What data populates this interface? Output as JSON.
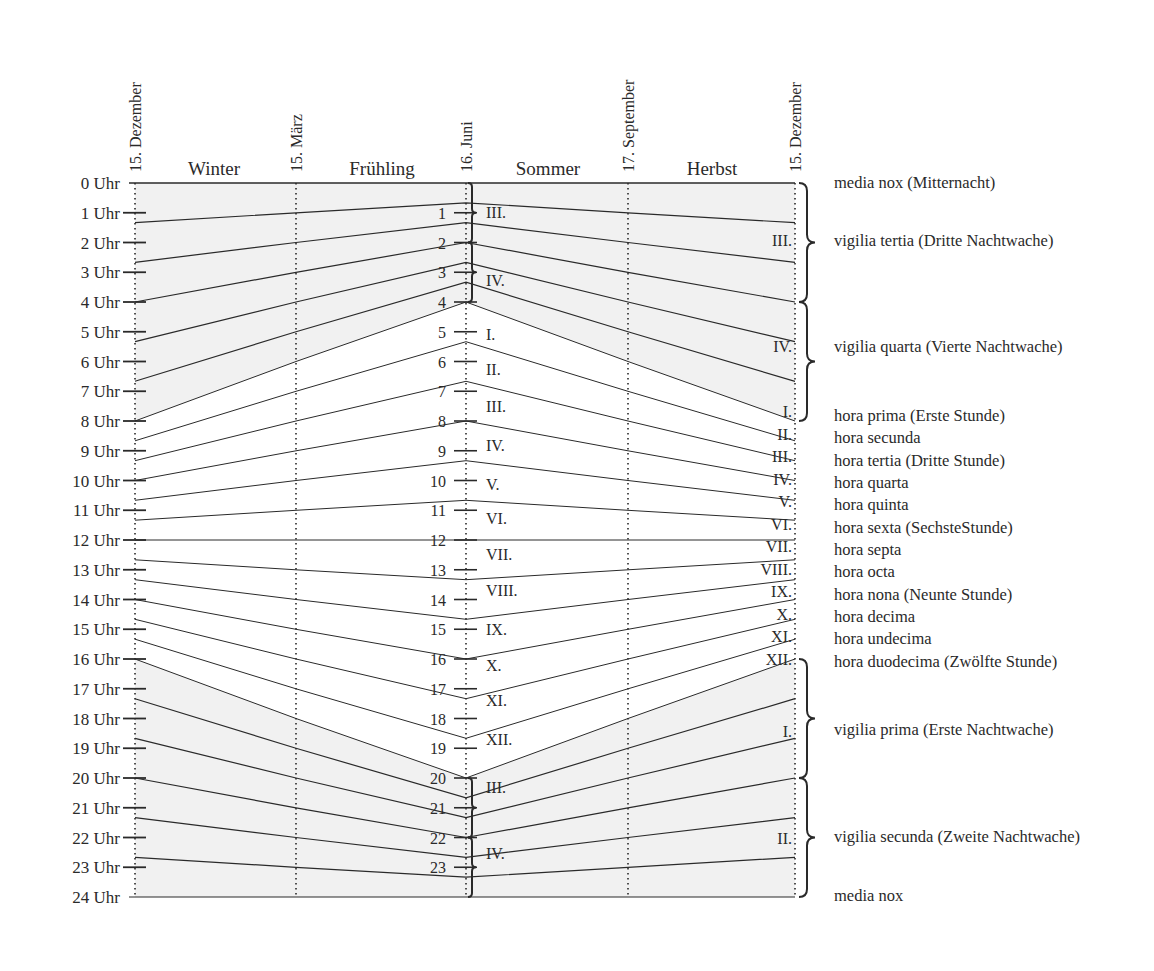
{
  "diagram": {
    "title": "",
    "date_markers": [
      {
        "label": "15. Dezember",
        "x": 135
      },
      {
        "label": "15. März",
        "x": 296
      },
      {
        "label": "16. Juni",
        "x": 466
      },
      {
        "label": "17. September",
        "x": 628
      },
      {
        "label": "15. Dezember",
        "x": 795
      }
    ],
    "seasons": [
      {
        "label": "Winter",
        "x": 214
      },
      {
        "label": "Frühling",
        "x": 382
      },
      {
        "label": "Sommer",
        "x": 548
      },
      {
        "label": "Herbst",
        "x": 712
      }
    ],
    "hour_axis": {
      "labels": [
        "0 Uhr",
        "1 Uhr",
        "2 Uhr",
        "3 Uhr",
        "4 Uhr",
        "5 Uhr",
        "6 Uhr",
        "7 Uhr",
        "8 Uhr",
        "9 Uhr",
        "10 Uhr",
        "11 Uhr",
        "12 Uhr",
        "13 Uhr",
        "14 Uhr",
        "15 Uhr",
        "16 Uhr",
        "17 Uhr",
        "18 Uhr",
        "19 Uhr",
        "20 Uhr",
        "21 Uhr",
        "22 Uhr",
        "23 Uhr",
        "24 Uhr"
      ],
      "y_top": 183,
      "y_bottom": 897
    },
    "center_numbers": [
      "1",
      "2",
      "3",
      "4",
      "5",
      "6",
      "7",
      "8",
      "9",
      "10",
      "11",
      "12",
      "13",
      "14",
      "15",
      "16",
      "17",
      "18",
      "19",
      "20",
      "21",
      "22",
      "23"
    ],
    "sunrise_hour": {
      "winter": 8,
      "equinox": 6,
      "summer": 4
    },
    "sunset_hour": {
      "winter": 16,
      "equinox": 18,
      "summer": 20
    },
    "center_roman_labels": [
      {
        "label": "III.",
        "y": 218
      },
      {
        "label": "IV.",
        "y": 286
      },
      {
        "label": "I.",
        "y": 340
      },
      {
        "label": "II.",
        "y": 375
      },
      {
        "label": "III.",
        "y": 412
      },
      {
        "label": "IV.",
        "y": 451
      },
      {
        "label": "V.",
        "y": 490
      },
      {
        "label": "VI.",
        "y": 524
      },
      {
        "label": "VII.",
        "y": 560
      },
      {
        "label": "VIII.",
        "y": 596
      },
      {
        "label": "IX.",
        "y": 635
      },
      {
        "label": "X.",
        "y": 671
      },
      {
        "label": "XI.",
        "y": 706
      },
      {
        "label": "XII.",
        "y": 745
      },
      {
        "label": "III.",
        "y": 793
      },
      {
        "label": "IV.",
        "y": 859
      }
    ],
    "right_roman_labels": [
      {
        "label": "III.",
        "y": 246
      },
      {
        "label": "IV.",
        "y": 352
      },
      {
        "label": "I.",
        "y": 417
      },
      {
        "label": "II.",
        "y": 440
      },
      {
        "label": "III.",
        "y": 462
      },
      {
        "label": "IV.",
        "y": 485
      },
      {
        "label": "V.",
        "y": 507
      },
      {
        "label": "VI.",
        "y": 530
      },
      {
        "label": "VII.",
        "y": 552
      },
      {
        "label": "VIII.",
        "y": 575
      },
      {
        "label": "IX.",
        "y": 597
      },
      {
        "label": "X.",
        "y": 620
      },
      {
        "label": "XI.",
        "y": 642
      },
      {
        "label": "XII.",
        "y": 665
      },
      {
        "label": "I.",
        "y": 737
      },
      {
        "label": "II.",
        "y": 844
      }
    ],
    "legend": [
      {
        "label": "media nox (Mitternacht)",
        "y": 188
      },
      {
        "label": "vigilia tertia (Dritte Nachtwache)",
        "y": 246
      },
      {
        "label": "vigilia quarta (Vierte Nachtwache)",
        "y": 352
      },
      {
        "label": "hora prima (Erste Stunde)",
        "y": 421
      },
      {
        "label": "hora secunda",
        "y": 443
      },
      {
        "label": "hora tertia (Dritte Stunde)",
        "y": 466
      },
      {
        "label": "hora quarta",
        "y": 488
      },
      {
        "label": "hora quinta",
        "y": 510
      },
      {
        "label": "hora sexta (SechsteStunde)",
        "y": 533
      },
      {
        "label": "hora septa",
        "y": 555
      },
      {
        "label": "hora octa",
        "y": 577
      },
      {
        "label": "hora nona (Neunte Stunde)",
        "y": 600
      },
      {
        "label": "hora decima",
        "y": 622
      },
      {
        "label": "hora undecima",
        "y": 644
      },
      {
        "label": "hora duodecima (Zwölfte Stunde)",
        "y": 667
      },
      {
        "label": "vigilia prima (Erste Nachtwache)",
        "y": 735
      },
      {
        "label": "vigilia secunda (Zweite Nachtwache)",
        "y": 842
      },
      {
        "label": "media nox",
        "y": 901
      }
    ],
    "colors": {
      "ink": "#2a2a2a",
      "night_shade": "#f1f1f1",
      "day": "#ffffff"
    }
  }
}
